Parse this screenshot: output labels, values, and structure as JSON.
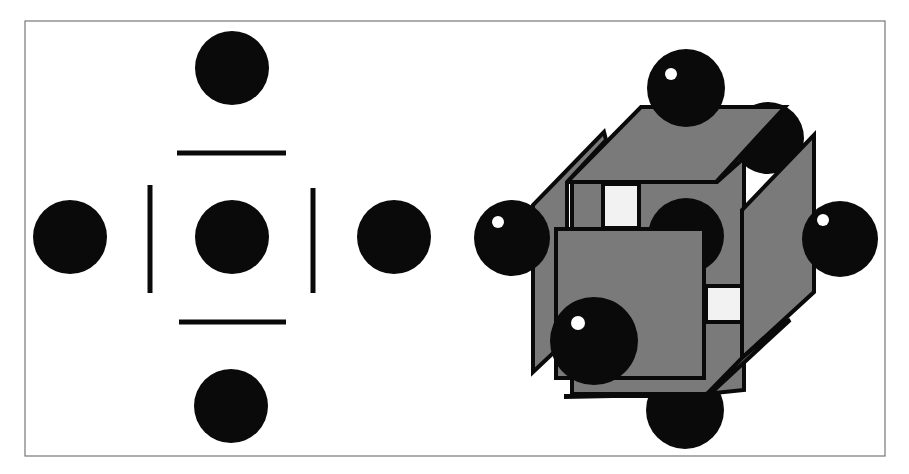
{
  "figure": {
    "title": "",
    "panels": [
      {
        "id": "planar-projection",
        "description": "2D projection: central atom with four coordinating atoms (up, down, left, right) separated by bond bars",
        "atoms": [
          "top",
          "left",
          "center",
          "right",
          "bottom"
        ],
        "bars": [
          "top",
          "left",
          "right",
          "bottom"
        ]
      },
      {
        "id": "cube-perspective",
        "description": "3D cube with spheres at face centers (octahedral arrangement)",
        "spheres": [
          "top",
          "back-right",
          "left",
          "center",
          "right",
          "front",
          "bottom"
        ],
        "faces": [
          "top",
          "left",
          "front",
          "right",
          "bottom"
        ]
      }
    ],
    "colors": {
      "atom": "#0a0a0a",
      "face": "#7a7a7a",
      "frame": "#777777",
      "highlight": "#ffffff",
      "gap": "#f2f2f2"
    }
  }
}
